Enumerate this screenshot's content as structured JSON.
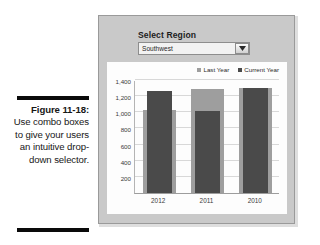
{
  "caption": {
    "figure_number": "Figure 11-18:",
    "text": "Use combo boxes to give your users an intuitive drop-down selector."
  },
  "panel": {
    "combo_label": "Select Region",
    "combo_value": "Southwest",
    "combo_arrow_icon": "chevron-down-icon"
  },
  "colors": {
    "panel_background": "#c9c9c9",
    "chart_background": "#fdfdfd",
    "last_year": "#9e9e9e",
    "current_year": "#4a4a4a",
    "gridline": "#d8d8d8",
    "rule": "#0a0a0a"
  },
  "chart_data": {
    "type": "bar",
    "title": "",
    "xlabel": "",
    "ylabel": "",
    "categories": [
      "2012",
      "2011",
      "2010"
    ],
    "series": [
      {
        "name": "Last Year",
        "values": [
          1030,
          1290,
          1300
        ],
        "color": "#9e9e9e"
      },
      {
        "name": "Current Year",
        "values": [
          1270,
          1020,
          1295
        ],
        "color": "#4a4a4a"
      }
    ],
    "ylim": [
      0,
      1400
    ],
    "yticks": [
      200,
      400,
      600,
      800,
      1000,
      1200,
      1400
    ],
    "ytick_labels": [
      "200",
      "400",
      "600",
      "800",
      "1,000",
      "1,200",
      "1,400"
    ],
    "grid": true,
    "legend_position": "top-right",
    "legend": [
      "Last Year",
      "Current Year"
    ]
  }
}
